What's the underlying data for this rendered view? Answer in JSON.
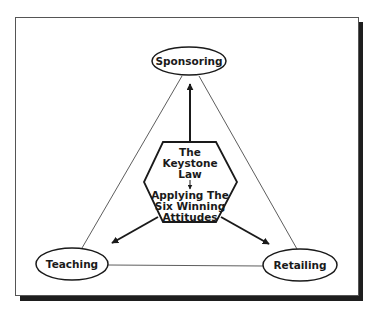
{
  "diagram": {
    "center": {
      "line1": "The",
      "line2": "Keystone",
      "line3": "Law",
      "line4": "Applying The",
      "line5": "Six Winning",
      "line6": "Attitudes"
    },
    "nodes": {
      "top": "Sponsoring",
      "left": "Teaching",
      "right": "Retailing"
    },
    "colors": {
      "stroke": "#1a1a1a",
      "shadow": "#1e1e1e",
      "frame": "#555555",
      "background": "#ffffff"
    }
  }
}
